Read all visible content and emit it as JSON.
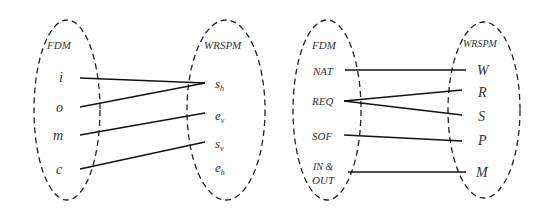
{
  "diagrams": [
    {
      "left_set": {
        "title": "FDM",
        "items": [
          "i",
          "o",
          "m",
          "c"
        ]
      },
      "right_set": {
        "title": "WRSPM",
        "items": [
          {
            "base": "s",
            "sub": "h"
          },
          {
            "base": "e",
            "sub": "v"
          },
          {
            "base": "s",
            "sub": "v"
          },
          {
            "base": "e",
            "sub": "h"
          }
        ]
      },
      "mappings": [
        [
          "i",
          "s_h"
        ],
        [
          "o",
          "s_h"
        ],
        [
          "m",
          "e_v"
        ],
        [
          "c",
          "s_v"
        ]
      ]
    },
    {
      "left_set": {
        "title": "FDM",
        "items": [
          "NAT",
          "REQ",
          "SOF",
          "IN &",
          "OUT"
        ]
      },
      "right_set": {
        "title": "WRSPM",
        "items": [
          "W",
          "R",
          "S",
          "P",
          "M"
        ]
      },
      "mappings": [
        [
          "NAT",
          "W"
        ],
        [
          "REQ",
          "R"
        ],
        [
          "REQ",
          "S"
        ],
        [
          "SOF",
          "P"
        ],
        [
          "IN & OUT",
          "M"
        ]
      ]
    }
  ]
}
